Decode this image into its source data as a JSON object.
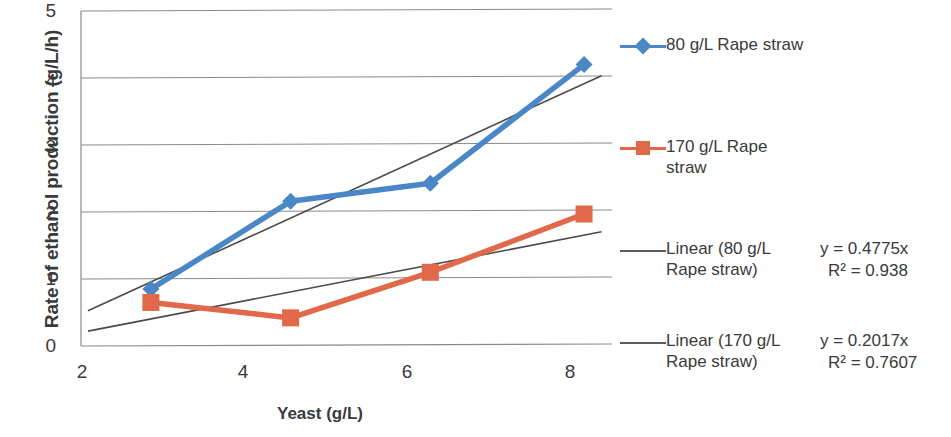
{
  "chart_data": {
    "type": "line",
    "title": "",
    "xlabel": "Yeast (g/L)",
    "ylabel": "Rate of ethanol production  (g/L/h)",
    "xlim": [
      1.0,
      8.6
    ],
    "ylim": [
      0,
      5
    ],
    "xticks": [
      2,
      4,
      6,
      8
    ],
    "yticks": [
      0,
      1,
      2,
      3,
      4,
      5
    ],
    "grid": "horizontal",
    "legend_position": "right",
    "x": [
      2,
      4,
      6,
      8.2
    ],
    "series": [
      {
        "name": "80 g/L Rape straw",
        "color": "#4a87c6",
        "marker": "diamond",
        "values": [
          0.85,
          2.16,
          2.43,
          4.2
        ]
      },
      {
        "name": "170 g/L Rape straw",
        "color": "#e2684a",
        "marker": "square",
        "values": [
          0.65,
          0.42,
          1.1,
          1.97
        ]
      }
    ],
    "trendlines": [
      {
        "name": "Linear (80 g/L Rape straw)",
        "color": "#4a4a4a",
        "equation": "y = 0.4775x",
        "r_squared": "R² = 0.938",
        "slope": 0.4775,
        "intercept": 0
      },
      {
        "name": "Linear (170 g/L Rape straw)",
        "color": "#4a4a4a",
        "equation": "y = 0.2017x",
        "r_squared": "R² = 0.7607",
        "slope": 0.2017,
        "intercept": 0
      }
    ]
  },
  "axes": {
    "y_title": "Rate of ethanol production  (g/L/h)",
    "x_title": "Yeast (g/L)",
    "y_tick_labels": [
      "5",
      "4",
      "3",
      "2",
      "1",
      "0"
    ],
    "x_tick_labels": [
      "2",
      "4",
      "6",
      "8"
    ]
  },
  "legend": {
    "entries": [
      {
        "label": "80 g/L Rape straw",
        "key": "line-diamond-marker",
        "color": "#4a87c6"
      },
      {
        "label": "170 g/L Rape\nstraw",
        "key": "line-square-marker",
        "color": "#e2684a"
      },
      {
        "label": "Linear (80 g/L\nRape straw)",
        "key": "trendline",
        "color": "#5b5b5b"
      },
      {
        "label": "Linear (170 g/L\nRape straw)",
        "key": "trendline",
        "color": "#5b5b5b"
      }
    ]
  },
  "equations": [
    {
      "equation": "y = 0.4775x",
      "r_squared": "R² = 0.938"
    },
    {
      "equation": "y = 0.2017x",
      "r_squared": "R² = 0.7607"
    }
  ]
}
